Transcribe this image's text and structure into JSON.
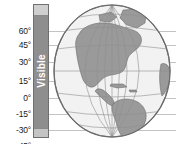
{
  "figure": {
    "axis_label": "Visible",
    "background_color": "#ffffff"
  },
  "latitude_axis": {
    "unit": "degrees",
    "ticks": [
      {
        "label": "60°",
        "value": 60,
        "y": 31
      },
      {
        "label": "45°",
        "value": 45,
        "y": 45
      },
      {
        "label": "30°",
        "value": 30,
        "y": 62
      },
      {
        "label": "15°",
        "value": 15,
        "y": 81
      },
      {
        "label": "0°",
        "value": 0,
        "y": 98
      },
      {
        "label": "-15°",
        "value": -15,
        "y": 114
      },
      {
        "label": "-30°",
        "value": -30,
        "y": 130
      },
      {
        "label": "-45°",
        "value": -45,
        "y": 146
      }
    ]
  },
  "visible_bar": {
    "label": "Visible",
    "fill_color": "#8e8e8e",
    "cap_color": "#cfcfcf",
    "text_color": "#ffffff"
  },
  "gridlines": {
    "color": "#b9b9b9"
  },
  "globe": {
    "name": "earth-globe",
    "region_shown": "Americas",
    "ocean_color": "#f2f2f2",
    "land_color": "#9a9a9a",
    "graticule_color": "#9a9a9a",
    "outline_color": "#6b6b6b"
  }
}
